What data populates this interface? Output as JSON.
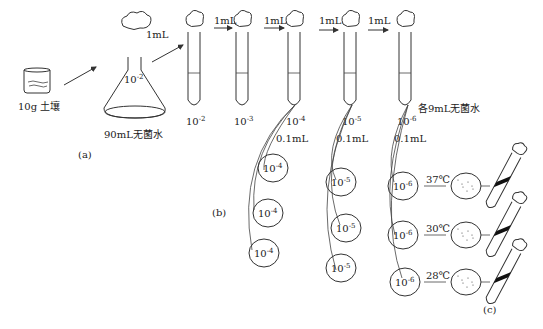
{
  "labels": {
    "soil": "10g 土壤",
    "flask_water": "90mL无菌水",
    "flask_dilution": "10",
    "flask_exp": "-2",
    "transfer_1ml": "1mL",
    "each_tube_water": "各9mL无菌水",
    "transfer_01ml": "0.1mL",
    "part_a": "(a)",
    "part_b": "(b)",
    "part_c": "(c)"
  },
  "tubes": [
    {
      "base": "10",
      "exp": "-2"
    },
    {
      "base": "10",
      "exp": "-3"
    },
    {
      "base": "10",
      "exp": "-4"
    },
    {
      "base": "10",
      "exp": "-5"
    },
    {
      "base": "10",
      "exp": "-6"
    }
  ],
  "plates": [
    {
      "exp": "-4"
    },
    {
      "exp": "-4"
    },
    {
      "exp": "-4"
    },
    {
      "exp": "-5"
    },
    {
      "exp": "-5"
    },
    {
      "exp": "-5"
    },
    {
      "exp": "-6"
    },
    {
      "exp": "-6"
    },
    {
      "exp": "-6"
    }
  ],
  "incubation": [
    {
      "temp": "37℃"
    },
    {
      "temp": "30℃"
    },
    {
      "temp": "28℃"
    }
  ]
}
